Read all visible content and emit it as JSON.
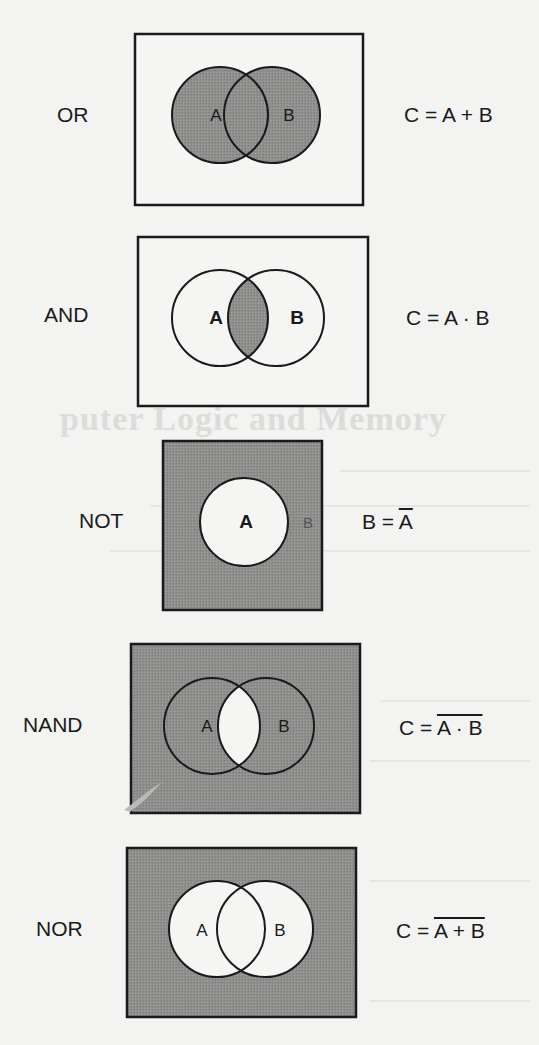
{
  "colors": {
    "page_background": "#f3f3f1",
    "shading": "#8e8e8c",
    "outline": "#1a1a1a",
    "unshaded": "#f5f5f3"
  },
  "gates": [
    {
      "name": "OR",
      "label": "OR",
      "formula_lhs": "C = ",
      "formula_overline": "",
      "formula_plain": "A + B",
      "set_a": "A",
      "set_b": "B",
      "shaded_region": "A ∪ B"
    },
    {
      "name": "AND",
      "label": "AND",
      "formula_lhs": "C = ",
      "formula_overline": "",
      "formula_plain": "A · B",
      "set_a": "A",
      "set_b": "B",
      "shaded_region": "A ∩ B"
    },
    {
      "name": "NOT",
      "label": "NOT",
      "formula_lhs": "B = ",
      "formula_overline": "A",
      "formula_plain": "",
      "set_a": "A",
      "set_b": "B",
      "shaded_region": "complement of A"
    },
    {
      "name": "NAND",
      "label": "NAND",
      "formula_lhs": "C = ",
      "formula_overline": "A · B",
      "formula_plain": "",
      "set_a": "A",
      "set_b": "B",
      "shaded_region": "complement of A ∩ B"
    },
    {
      "name": "NOR",
      "label": "NOR",
      "formula_lhs": "C = ",
      "formula_overline": "A + B",
      "formula_plain": "",
      "set_a": "A",
      "set_b": "B",
      "shaded_region": "complement of A ∪ B"
    }
  ],
  "bleed_through": {
    "title": "puter Logic and Memory"
  }
}
